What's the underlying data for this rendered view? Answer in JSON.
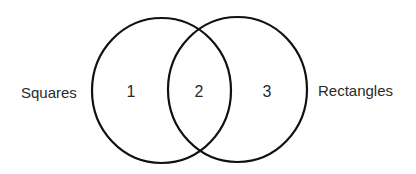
{
  "diagram": {
    "type": "venn",
    "sets": [
      {
        "label": "Squares",
        "color": "#111111"
      },
      {
        "label": "Rectangles",
        "color": "#111111"
      }
    ],
    "regions": [
      {
        "label": "1"
      },
      {
        "label": "2"
      },
      {
        "label": "3"
      }
    ]
  }
}
